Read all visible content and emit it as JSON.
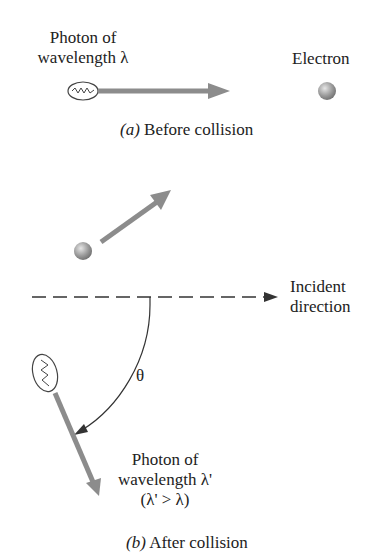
{
  "part_a": {
    "photon_label_line1": "Photon of",
    "photon_label_line2": "wavelength λ",
    "electron_label": "Electron",
    "caption_letter": "(a)",
    "caption_text": " Before collision"
  },
  "part_b": {
    "incident_label_line1": "Incident",
    "incident_label_line2": "direction",
    "angle_label": "θ",
    "photon_label_line1": "Photon of",
    "photon_label_line2": "wavelength λ'",
    "photon_label_line3": "(λ' > λ)",
    "caption_letter": "(b)",
    "caption_text": " After collision"
  },
  "colors": {
    "arrow_gray": "#8c8c8c",
    "line_dark": "#333333",
    "electron_light": "#d8d8d8",
    "electron_dark": "#7a7a7a"
  }
}
